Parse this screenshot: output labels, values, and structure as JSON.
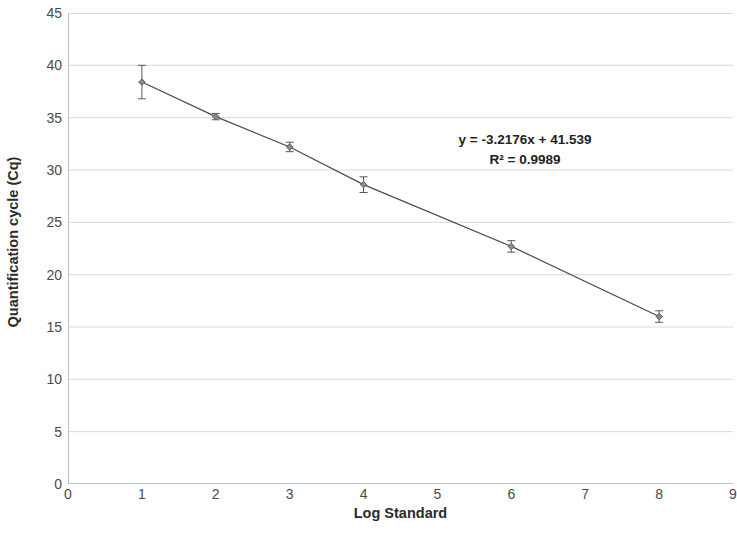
{
  "chart_data": {
    "type": "scatter",
    "title": "",
    "xlabel": "Log Standard",
    "ylabel": "Quantification cycle (Cq)",
    "xlim": [
      0,
      9
    ],
    "ylim": [
      0,
      45
    ],
    "xticks": [
      0,
      1,
      2,
      3,
      4,
      5,
      6,
      7,
      8,
      9
    ],
    "yticks": [
      0,
      5,
      10,
      15,
      20,
      25,
      30,
      35,
      40,
      45
    ],
    "grid": "horizontal",
    "legend": "none",
    "series": [
      {
        "name": "Standard curve",
        "x": [
          1,
          2,
          3,
          4,
          6,
          8
        ],
        "values": [
          38.4,
          35.1,
          32.2,
          28.6,
          22.7,
          16.0
        ],
        "error": [
          1.6,
          0.3,
          0.45,
          0.75,
          0.55,
          0.55
        ],
        "marker": "diamond",
        "color": "#595959",
        "line_color": "#4a4a4a"
      }
    ],
    "trendline": {
      "slope": -3.2176,
      "intercept": 41.539,
      "r_squared": 0.9989
    },
    "annotations": {
      "equation": "y = -3.2176x + 41.539",
      "r_squared": "R² = 0.9989"
    },
    "colors": {
      "background": "#ffffff",
      "gridline": "#d9d9d9",
      "axis": "#bfbfbf",
      "text": "#404040",
      "marker": "#595959"
    }
  }
}
